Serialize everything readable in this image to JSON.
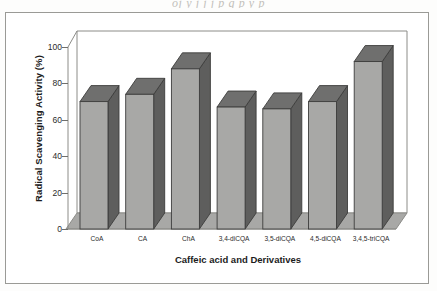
{
  "scan": {
    "top_artifact_text": "oj    y     j   j   j   p        g     p y p"
  },
  "chart_data": {
    "type": "bar",
    "title": "",
    "subtitle": "",
    "xlabel": "Caffeic acid and Derivatives",
    "ylabel": "Radical Scavenging Activity (%)",
    "categories": [
      "CoA",
      "CA",
      "ChA",
      "3,4-diCQA",
      "3,5-diCQA",
      "4,5-diCQA",
      "3,4,5-triCQA"
    ],
    "values": [
      70,
      74,
      88,
      67,
      66,
      70,
      92
    ],
    "ylim": [
      0,
      100
    ],
    "yticks": [
      0,
      20,
      40,
      60,
      80,
      100
    ],
    "ytick_labels": [
      "0",
      "20",
      "40",
      "60",
      "80",
      "100"
    ],
    "grid": false,
    "legend": "none",
    "style": "3d-column",
    "colors": {
      "bar_front": "#a8a8a6",
      "bar_top": "#6f6f6e",
      "bar_side": "#5e5e5d",
      "bar_outline": "#3d3d3c",
      "floor": "#a8a8a6",
      "wall": "#ffffff",
      "axis": "#8c8c88",
      "text": "#1c1c1c",
      "frame_border": "#9a9a96"
    }
  }
}
